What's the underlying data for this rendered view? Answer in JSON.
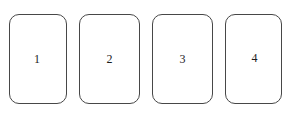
{
  "canvas": {
    "width": 287,
    "height": 116,
    "background_color": "#ffffff"
  },
  "style": {
    "card_fill": "#ffffff",
    "card_border_color": "#474747",
    "card_border_width": 1,
    "card_corner_radius": 10,
    "label_color": "#1c1c1c",
    "label_font_size": 12
  },
  "cards": [
    {
      "label": "1"
    },
    {
      "label": "2"
    },
    {
      "label": "3"
    },
    {
      "label": "4"
    }
  ]
}
